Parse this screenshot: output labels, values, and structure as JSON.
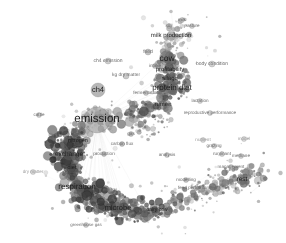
{
  "figure": {
    "kind": "bibliometric-network-map",
    "title": "",
    "background_color": "#ffffff",
    "width": 286,
    "height": 243,
    "palette": {
      "node_dark": "#4a4a4a",
      "node_mid": "#8c8c8c",
      "node_light": "#c4c4c4",
      "edge": "#d2d2d2",
      "label_dark": "#1d1d1d",
      "label_faint": "#6a6a6a",
      "label_vfaint": "#9a9a9a"
    }
  },
  "chart_data": {
    "type": "scatter",
    "title": "",
    "xlabel": "",
    "ylabel": "",
    "grid": false,
    "legend": null,
    "xlim": [
      0,
      286
    ],
    "ylim": [
      0,
      243
    ],
    "nodes": [
      {
        "label": "emission",
        "x": 97,
        "y": 120,
        "size": 26,
        "font": 11.5,
        "tone": "dark",
        "gray": "#9a9a9a"
      },
      {
        "label": "cow",
        "x": 167,
        "y": 58,
        "size": 15,
        "font": 8.5,
        "tone": "dark",
        "gray": "#6f6f6f"
      },
      {
        "label": "protein diet",
        "x": 172,
        "y": 88,
        "size": 13,
        "font": 8.0,
        "tone": "dark",
        "gray": "#5e5e5e"
      },
      {
        "label": "milk production",
        "x": 171,
        "y": 36,
        "size": 9,
        "font": 6.0,
        "tone": "dark",
        "gray": "#8d8d8d"
      },
      {
        "label": "ch4",
        "x": 98,
        "y": 90,
        "size": 14,
        "font": 7.5,
        "tone": "dark",
        "gray": "#8a8a8a"
      },
      {
        "label": "respiration",
        "x": 77,
        "y": 187,
        "size": 14,
        "font": 8.0,
        "tone": "dark",
        "gray": "#5a5a5a"
      },
      {
        "label": "microbe",
        "x": 118,
        "y": 208,
        "size": 12,
        "font": 7.5,
        "tone": "dark",
        "gray": "#5a5a5a"
      },
      {
        "label": "exchange",
        "x": 69,
        "y": 155,
        "size": 10,
        "font": 6.5,
        "tone": "dark",
        "gray": "#565656"
      },
      {
        "label": "profitability",
        "x": 170,
        "y": 70,
        "size": 9,
        "font": 6.0,
        "tone": "dark",
        "gray": "#6b6b6b"
      },
      {
        "label": "silage",
        "x": 170,
        "y": 79,
        "size": 9,
        "font": 6.0,
        "tone": "dark",
        "gray": "#666666"
      },
      {
        "label": "rumen",
        "x": 163,
        "y": 105,
        "size": 9,
        "font": 6.0,
        "tone": "dark",
        "gray": "#606060"
      },
      {
        "label": "rest",
        "x": 242,
        "y": 180,
        "size": 10,
        "font": 6.5,
        "tone": "dark",
        "gray": "#666666"
      },
      {
        "label": "nitrogen",
        "x": 78,
        "y": 142,
        "size": 8,
        "font": 5.5,
        "tone": "dark",
        "gray": "#4f4f4f"
      },
      {
        "label": "diet",
        "x": 72,
        "y": 169,
        "size": 8,
        "font": 5.5,
        "tone": "dark",
        "gray": "#4c4c4c"
      },
      {
        "label": "dairy cow",
        "x": 157,
        "y": 210,
        "size": 7,
        "font": 5.0,
        "tone": "dark",
        "gray": "#565656"
      },
      {
        "label": "body condition",
        "x": 212,
        "y": 64,
        "size": 6,
        "font": 5.0,
        "tone": "faint",
        "gray": "#b5b5b5"
      },
      {
        "label": "ch4 emission",
        "x": 108,
        "y": 61,
        "size": 6,
        "font": 5.0,
        "tone": "faint",
        "gray": "#b0b0b0"
      },
      {
        "label": "kg dry matter",
        "x": 126,
        "y": 76,
        "size": 6,
        "font": 4.8,
        "tone": "faint",
        "gray": "#a8a8a8"
      },
      {
        "label": "reproductive performance",
        "x": 210,
        "y": 113,
        "size": 5,
        "font": 4.6,
        "tone": "faint",
        "gray": "#b6b6b6"
      },
      {
        "label": "lactation",
        "x": 200,
        "y": 101,
        "size": 5,
        "font": 4.6,
        "tone": "faint",
        "gray": "#b8b8b8"
      },
      {
        "label": "feed",
        "x": 148,
        "y": 52,
        "size": 6,
        "font": 5.0,
        "tone": "faint",
        "gray": "#9c9c9c"
      },
      {
        "label": "milk",
        "x": 182,
        "y": 20,
        "size": 5,
        "font": 4.6,
        "tone": "faint",
        "gray": "#b0b0b0"
      },
      {
        "label": "pasture",
        "x": 192,
        "y": 26,
        "size": 5,
        "font": 4.6,
        "tone": "faint",
        "gray": "#b4b4b4"
      },
      {
        "label": "soil",
        "x": 169,
        "y": 26,
        "size": 5,
        "font": 4.6,
        "tone": "faint",
        "gray": "#a6a6a6"
      },
      {
        "label": "intake",
        "x": 155,
        "y": 66,
        "size": 5,
        "font": 4.6,
        "tone": "faint",
        "gray": "#9d9d9d"
      },
      {
        "label": "fermentation",
        "x": 146,
        "y": 93,
        "size": 5,
        "font": 4.6,
        "tone": "faint",
        "gray": "#a0a0a0"
      },
      {
        "label": "carbon flux",
        "x": 122,
        "y": 144,
        "size": 5,
        "font": 4.6,
        "tone": "faint",
        "gray": "#8e8e8e"
      },
      {
        "label": "production",
        "x": 104,
        "y": 154,
        "size": 5,
        "font": 4.6,
        "tone": "faint",
        "gray": "#8b8b8b"
      },
      {
        "label": "gas",
        "x": 131,
        "y": 134,
        "size": 5,
        "font": 4.6,
        "tone": "faint",
        "gray": "#8f8f8f"
      },
      {
        "label": "analysis",
        "x": 167,
        "y": 155,
        "size": 5,
        "font": 4.6,
        "tone": "faint",
        "gray": "#a4a4a4"
      },
      {
        "label": "grazing",
        "x": 214,
        "y": 146,
        "size": 5,
        "font": 4.6,
        "tone": "faint",
        "gray": "#b0b0b0"
      },
      {
        "label": "ruminant",
        "x": 222,
        "y": 154,
        "size": 5,
        "font": 4.6,
        "tone": "faint",
        "gray": "#aeaeae"
      },
      {
        "label": "methane",
        "x": 241,
        "y": 156,
        "size": 5,
        "font": 4.6,
        "tone": "faint",
        "gray": "#b2b2b2"
      },
      {
        "label": "management",
        "x": 231,
        "y": 167,
        "size": 5,
        "font": 4.6,
        "tone": "faint",
        "gray": "#a2a2a2"
      },
      {
        "label": "modelling",
        "x": 186,
        "y": 180,
        "size": 5,
        "font": 4.6,
        "tone": "faint",
        "gray": "#9b9b9b"
      },
      {
        "label": "feed performance",
        "x": 196,
        "y": 188,
        "size": 5,
        "font": 4.6,
        "tone": "faint",
        "gray": "#9e9e9e"
      },
      {
        "label": "cattle",
        "x": 39,
        "y": 115,
        "size": 5,
        "font": 4.6,
        "tone": "faint",
        "gray": "#a9a9a9"
      },
      {
        "label": "dry matter",
        "x": 33,
        "y": 172,
        "size": 5,
        "font": 4.6,
        "tone": "vfaint",
        "gray": "#bdbdbd"
      },
      {
        "label": "greenhouse gas",
        "x": 86,
        "y": 225,
        "size": 5,
        "font": 4.4,
        "tone": "faint",
        "gray": "#a7a7a7"
      },
      {
        "label": "energy",
        "x": 110,
        "y": 190,
        "size": 5,
        "font": 4.6,
        "tone": "faint",
        "gray": "#8a8a8a"
      },
      {
        "label": "yield",
        "x": 151,
        "y": 216,
        "size": 5,
        "font": 4.6,
        "tone": "faint",
        "gray": "#8e8e8e"
      },
      {
        "label": "model",
        "x": 244,
        "y": 139,
        "size": 5,
        "font": 4.6,
        "tone": "vfaint",
        "gray": "#c0c0c0"
      },
      {
        "label": "nutrient",
        "x": 203,
        "y": 140,
        "size": 5,
        "font": 4.6,
        "tone": "vfaint",
        "gray": "#bdbdbd"
      }
    ],
    "label_count": 43
  },
  "accessibility": {
    "alt": "Grayscale term co-occurrence network map of livestock methane and dairy research with clustered circular nodes and text labels."
  }
}
